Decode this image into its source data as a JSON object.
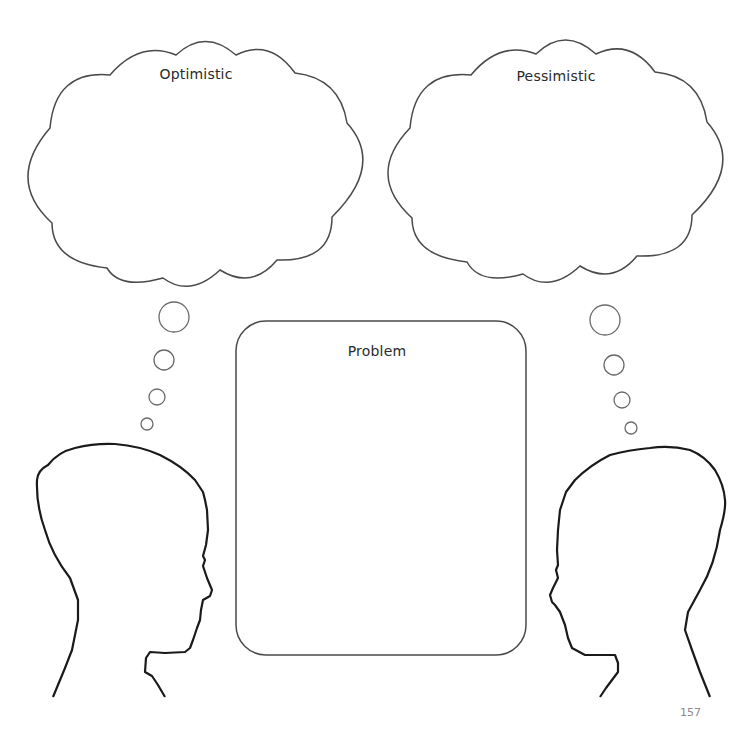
{
  "worksheet": {
    "thought_clouds": [
      {
        "id": "optimistic",
        "label": "Optimistic"
      },
      {
        "id": "pessimistic",
        "label": "Pessimistic"
      }
    ],
    "problem_box": {
      "label": "Problem"
    },
    "page_number": "157"
  },
  "colors": {
    "outline": "#4a4a4a",
    "head_outline": "#1a1a1a",
    "label_text": "#2a2a2a",
    "page_number": "#8a8a8a",
    "background": "#ffffff"
  },
  "icons": [
    "thought-cloud-icon",
    "thought-bubble-icon",
    "head-silhouette-icon"
  ]
}
